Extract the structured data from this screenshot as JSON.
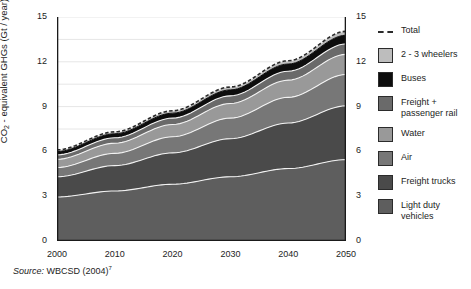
{
  "chart_data": {
    "type": "area",
    "title": "",
    "subtitle": "",
    "xlabel": "",
    "ylabel": "CO2 - equivalent GHGs (Gt / year)",
    "ylabel_parts": {
      "prefix": "CO",
      "sub": "2",
      "suffix": " - equivalent GHGs (Gt / year)"
    },
    "xlim": [
      2000,
      2050
    ],
    "ylim": [
      0,
      15
    ],
    "y_ticks_labeled": [
      0,
      3,
      6,
      9,
      12,
      15
    ],
    "y_ticks_minor_step": 1.5,
    "x_ticks": [
      2000,
      2010,
      2020,
      2030,
      2040,
      2050
    ],
    "x_tick_labels": [
      "2000",
      "2010",
      "2020",
      "2030",
      "2040",
      "2050"
    ],
    "y_tick_labels": [
      "0",
      "3",
      "6",
      "9",
      "12",
      "15"
    ],
    "grid": "horizontal",
    "grid_color": "#e6e6e6",
    "right_axis_mirrored": true,
    "legend_position": "right",
    "stacking": "cumulative-from-bottom",
    "x": [
      2000,
      2010,
      2020,
      2030,
      2040,
      2050
    ],
    "series": [
      {
        "name": "Light duty vehicles",
        "color": "#5e5e5e",
        "values": [
          2.95,
          3.35,
          3.8,
          4.3,
          4.85,
          5.45
        ]
      },
      {
        "name": "Freight trucks",
        "color": "#4a4a4a",
        "values": [
          1.35,
          1.7,
          2.1,
          2.55,
          3.05,
          3.6
        ]
      },
      {
        "name": "Air",
        "color": "#777777",
        "values": [
          0.62,
          0.82,
          1.08,
          1.38,
          1.72,
          2.1
        ]
      },
      {
        "name": "Water",
        "color": "#999999",
        "values": [
          0.55,
          0.68,
          0.82,
          0.98,
          1.15,
          1.35
        ]
      },
      {
        "name": "Freight + passenger rail",
        "color": "#6a6a6a",
        "values": [
          0.3,
          0.36,
          0.43,
          0.51,
          0.6,
          0.7
        ]
      },
      {
        "name": "Buses",
        "color": "#0d0d0d",
        "values": [
          0.22,
          0.27,
          0.33,
          0.4,
          0.48,
          0.58
        ]
      },
      {
        "name": "2 - 3 wheelers",
        "color": "#bdbdbd",
        "values": [
          0.11,
          0.13,
          0.16,
          0.19,
          0.22,
          0.26
        ]
      }
    ],
    "total_line": {
      "name": "Total",
      "style": "dashed",
      "color": "#2b2b2b",
      "values": [
        6.1,
        7.31,
        8.72,
        10.31,
        12.07,
        14.04
      ]
    }
  },
  "legend": {
    "items": [
      {
        "label": "Total",
        "key": "dashed-line",
        "color": "#2b2b2b"
      },
      {
        "label": "2 - 3 wheelers",
        "key": "swatch",
        "color": "#bdbdbd"
      },
      {
        "label": "Buses",
        "key": "swatch",
        "color": "#0d0d0d"
      },
      {
        "label": "Freight + passenger rail",
        "key": "swatch",
        "color": "#6a6a6a"
      },
      {
        "label": "Water",
        "key": "swatch",
        "color": "#999999"
      },
      {
        "label": "Air",
        "key": "swatch",
        "color": "#777777"
      },
      {
        "label": "Freight trucks",
        "key": "swatch",
        "color": "#4a4a4a"
      },
      {
        "label": "Light duty vehicles",
        "key": "swatch",
        "color": "#5e5e5e"
      }
    ]
  },
  "source": {
    "prefix": "Source:",
    "text": "WBCSD (2004)",
    "footnote": "7"
  }
}
